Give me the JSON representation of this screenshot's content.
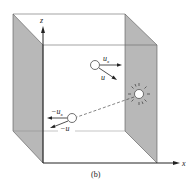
{
  "figure": {
    "caption": "(b)",
    "axes": {
      "x_label": "x",
      "z_label": "z"
    },
    "molecule_before": {
      "velocity_component_label": "u",
      "velocity_component_sub": "x",
      "velocity_label": "u"
    },
    "molecule_after": {
      "velocity_component_label": "−u",
      "velocity_component_sub": "x",
      "velocity_label": "−u"
    },
    "collision": {
      "description": "wall-collision-burst"
    },
    "colors": {
      "wall_shade": "#b8b8b8",
      "line": "#333333",
      "background": "#ffffff"
    }
  }
}
